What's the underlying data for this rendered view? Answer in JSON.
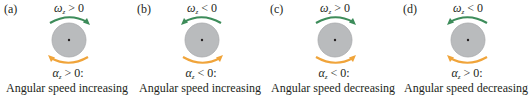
{
  "colors": {
    "omega_arrow": "#3d8c5a",
    "alpha_arrow": "#f0a43a",
    "disc_fill": "#b9bbbd",
    "disc_edge": "#a9abad",
    "text": "#231f20"
  },
  "panels": [
    {
      "label": "(a)",
      "omega": {
        "symbol": "ω",
        "sub": "z",
        "relation": " > 0",
        "arrow_direction": "right"
      },
      "alpha": {
        "symbol": "α",
        "sub": "z",
        "relation": " > 0:",
        "arrow_direction": "left"
      },
      "caption": "Angular speed increasing"
    },
    {
      "label": "(b)",
      "omega": {
        "symbol": "ω",
        "sub": "z",
        "relation": " < 0",
        "arrow_direction": "left"
      },
      "alpha": {
        "symbol": "α",
        "sub": "z",
        "relation": " < 0:",
        "arrow_direction": "right"
      },
      "caption": "Angular speed increasing"
    },
    {
      "label": "(c)",
      "omega": {
        "symbol": "ω",
        "sub": "z",
        "relation": " > 0",
        "arrow_direction": "right"
      },
      "alpha": {
        "symbol": "α",
        "sub": "z",
        "relation": " < 0:",
        "arrow_direction": "right"
      },
      "caption": "Angular speed decreasing"
    },
    {
      "label": "(d)",
      "omega": {
        "symbol": "ω",
        "sub": "z",
        "relation": " < 0",
        "arrow_direction": "left"
      },
      "alpha": {
        "symbol": "α",
        "sub": "z",
        "relation": " > 0:",
        "arrow_direction": "left"
      },
      "caption": "Angular speed decreasing"
    }
  ]
}
